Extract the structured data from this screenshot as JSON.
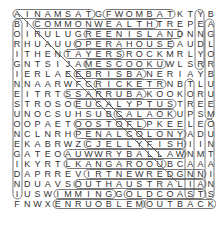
{
  "puzzle": {
    "rows": [
      "AINAMSATGFWOMBATKTYB",
      "BICOMMONWEALTHTREPEA",
      "OIRULUGREENISLANDNNG",
      "RHUAUUOPERAHOUSEAUDL",
      "ITHENTAYERSROCKMRLYO",
      "GNTSIJAMESCOOKUWLSRR",
      "IERLAEEBRISBANERIAYB",
      "NNAARWFCRICKETRNBTLU",
      "EITRTSSARRUBAKOOKORU",
      "STROSOEUCALYPTUSTREE",
      "UNOCSUHSUBCALAOKUPSM",
      "OOPAETOOSTOFLPKEELEO",
      "NCLNRHPENALCOLONYADU",
      "EKABRWZCJELLYFISHIIN",
      "GATEOAUWWRYBALLAWNMT",
      "IKYRTLKANGAROOUBCAAA",
      "DAPRREVIRTNEWREDGNNI",
      "NDUAVSOUTHAUSTRALIAN",
      "IUSWIMMINGGOLDCOASTS",
      "FNWXENRUOBLEMOUTBACK"
    ]
  }
}
